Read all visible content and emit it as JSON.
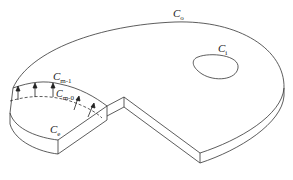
{
  "diagram": {
    "type": "3D slab with cut-away sector (boundary contours)",
    "labels": {
      "outer": {
        "main": "C",
        "sub": "o"
      },
      "inner": {
        "main": "C",
        "sub": "i"
      },
      "m1": {
        "main": "C",
        "sub": "m-1"
      },
      "m0": {
        "main": "C",
        "sub": "m-0"
      },
      "e": {
        "main": "C",
        "sub": "e"
      }
    },
    "arrows_count": 5
  }
}
